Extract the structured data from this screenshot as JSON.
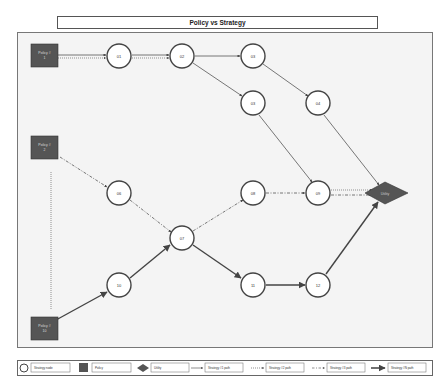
{
  "title": "Policy vs Strategy",
  "policies": [
    {
      "id": "p1",
      "label_line1": "Policy #",
      "label_line2": "1",
      "x": 44,
      "y": 56
    },
    {
      "id": "p2",
      "label_line1": "Policy #",
      "label_line2": "2",
      "x": 44,
      "y": 147
    },
    {
      "id": "p10",
      "label_line1": "Policy #",
      "label_line2": "10",
      "x": 44,
      "y": 328
    }
  ],
  "nodes": [
    {
      "id": "01",
      "label": "01",
      "x": 119,
      "y": 56
    },
    {
      "id": "02",
      "label": "02",
      "x": 182,
      "y": 56
    },
    {
      "id": "03",
      "label": "03",
      "x": 253,
      "y": 56
    },
    {
      "id": "05",
      "label": "03",
      "x": 253,
      "y": 103
    },
    {
      "id": "04",
      "label": "04",
      "x": 318,
      "y": 103
    },
    {
      "id": "06",
      "label": "06",
      "x": 119,
      "y": 193
    },
    {
      "id": "07",
      "label": "07",
      "x": 182,
      "y": 238
    },
    {
      "id": "08",
      "label": "08",
      "x": 253,
      "y": 193
    },
    {
      "id": "09",
      "label": "09",
      "x": 318,
      "y": 193
    },
    {
      "id": "10",
      "label": "10",
      "x": 119,
      "y": 285
    },
    {
      "id": "11",
      "label": "11",
      "x": 253,
      "y": 285
    },
    {
      "id": "12",
      "label": "12",
      "x": 318,
      "y": 285
    }
  ],
  "utility": {
    "label": "Utility",
    "x": 385,
    "y": 193
  },
  "legend": {
    "items": [
      {
        "symbol": "circle",
        "label": "Strategy node"
      },
      {
        "symbol": "square",
        "label": "Policy"
      },
      {
        "symbol": "diamond",
        "label": "Utility"
      },
      {
        "symbol": "line-solid",
        "label": "Strategy #1 path"
      },
      {
        "symbol": "line-dotted",
        "label": "Strategy #2 path"
      },
      {
        "symbol": "line-dashdot",
        "label": "Strategy #3 path"
      },
      {
        "symbol": "line-thick",
        "label": "Strategy #N path"
      }
    ]
  },
  "colors": {
    "policy_fill": "#555555",
    "node_stroke": "#444444",
    "edge": "#555555",
    "canvas_bg": "#f4f4f4"
  }
}
